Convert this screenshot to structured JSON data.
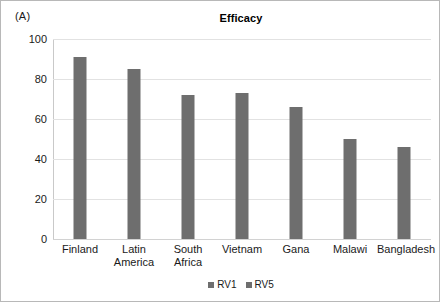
{
  "panel": {
    "label": "(A)"
  },
  "legend": {
    "position": "bottom-center",
    "items": [
      {
        "label": "RV1",
        "color": "#6e6e6e"
      },
      {
        "label": "RV5",
        "color": "#6e6e6e"
      }
    ]
  },
  "chart_data": {
    "type": "bar",
    "title": "Efficacy",
    "xlabel": "",
    "ylabel": "",
    "ylim": [
      0,
      100
    ],
    "yticks": [
      0,
      20,
      40,
      60,
      80,
      100
    ],
    "ytick_labels": [
      "0",
      "20",
      "40",
      "60",
      "80",
      "100"
    ],
    "grid": true,
    "legend": [
      "RV1",
      "RV5"
    ],
    "categories": [
      "Finland",
      "Latin\nAmerica",
      "South Africa",
      "Vietnam",
      "Gana",
      "Malawi",
      "Bangladesh"
    ],
    "series": [
      {
        "name": "RV1",
        "color": "#6e6e6e",
        "values": [
          91,
          85,
          72,
          73,
          66,
          50,
          46
        ]
      }
    ]
  }
}
